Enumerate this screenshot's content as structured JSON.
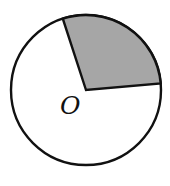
{
  "diagram": {
    "title": "",
    "center_label": "O",
    "shaded_sector": {
      "start_angle_deg": 108,
      "end_angle_deg": 5,
      "central_angle_deg": 103,
      "fill_color": "#a6a6a6"
    },
    "circle_fill": "#ffffff",
    "stroke_color": "#111111"
  }
}
